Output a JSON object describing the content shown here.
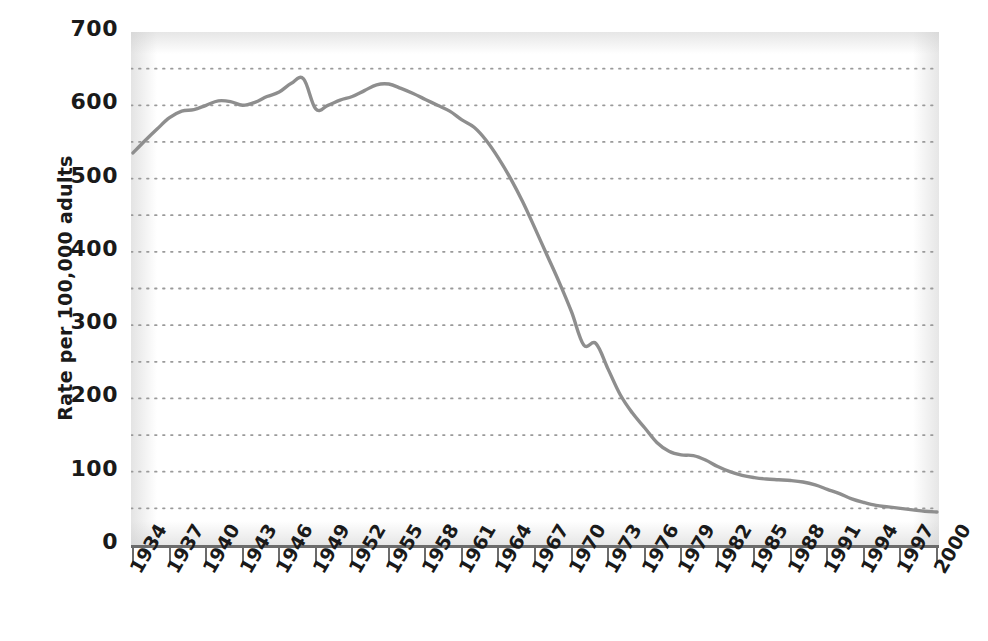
{
  "chart_data": {
    "type": "line",
    "title": "",
    "subtitle": "",
    "xlabel": "",
    "ylabel": "Rate per 100,000 adults",
    "xlim": [
      1934,
      2000
    ],
    "ylim": [
      0,
      700
    ],
    "grid": "horizontal-dotted-every-50",
    "legend": "none",
    "y_ticks": [
      700,
      600,
      500,
      400,
      300,
      200,
      100,
      0
    ],
    "y_tick_labels": [
      "700",
      "600",
      "500",
      "400",
      "300",
      "200",
      "100",
      "0"
    ],
    "y_minor_gridlines": [
      650,
      600,
      550,
      500,
      450,
      400,
      350,
      300,
      250,
      200,
      150,
      100,
      50
    ],
    "x_ticks": [
      1934,
      1937,
      1940,
      1943,
      1946,
      1949,
      1952,
      1955,
      1958,
      1961,
      1964,
      1967,
      1970,
      1973,
      1976,
      1979,
      1982,
      1985,
      1988,
      1991,
      1994,
      1997,
      2000
    ],
    "x_tick_labels": [
      "1934",
      "1937",
      "1940",
      "1943",
      "1946",
      "1949",
      "1952",
      "1955",
      "1958",
      "1961",
      "1964",
      "1967",
      "1970",
      "1973",
      "1976",
      "1979",
      "1982",
      "1985",
      "1988",
      "1991",
      "1994",
      "1997",
      "2000"
    ],
    "series": [
      {
        "name": "Rate per 100,000 adults",
        "color": "#8e8e8e",
        "x": [
          1934,
          1935,
          1936,
          1937,
          1938,
          1939,
          1940,
          1941,
          1942,
          1943,
          1944,
          1945,
          1946,
          1947,
          1948,
          1949,
          1950,
          1951,
          1952,
          1953,
          1954,
          1955,
          1956,
          1957,
          1958,
          1959,
          1960,
          1961,
          1962,
          1963,
          1964,
          1965,
          1966,
          1967,
          1968,
          1969,
          1970,
          1971,
          1972,
          1973,
          1974,
          1975,
          1976,
          1977,
          1978,
          1979,
          1980,
          1981,
          1982,
          1983,
          1984,
          1985,
          1986,
          1987,
          1988,
          1989,
          1990,
          1991,
          1992,
          1993,
          1994,
          1995,
          1996,
          1997,
          1998,
          1999,
          2000
        ],
        "values": [
          535,
          552,
          568,
          583,
          592,
          594,
          600,
          606,
          605,
          600,
          604,
          612,
          618,
          630,
          636,
          595,
          600,
          607,
          612,
          620,
          628,
          629,
          623,
          616,
          608,
          600,
          592,
          580,
          570,
          552,
          528,
          500,
          468,
          432,
          395,
          358,
          318,
          273,
          275,
          240,
          205,
          180,
          160,
          140,
          128,
          123,
          122,
          116,
          107,
          100,
          95,
          92,
          90,
          89,
          88,
          86,
          82,
          76,
          70,
          63,
          58,
          54,
          52,
          50,
          48,
          46,
          45
        ]
      }
    ]
  }
}
